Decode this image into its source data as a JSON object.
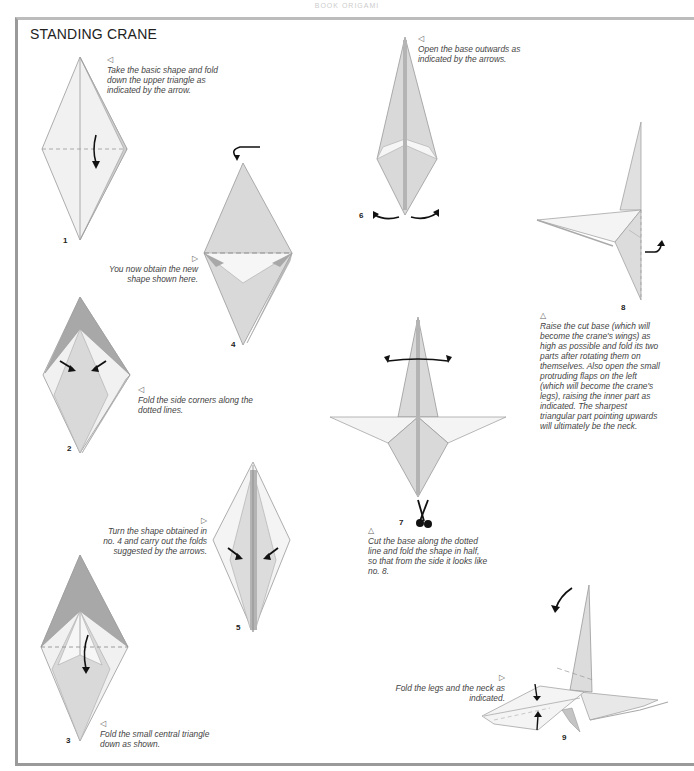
{
  "page_header": "BOOK ORIGAMI",
  "title": "STANDING CRANE",
  "colors": {
    "light_paper": "#f1f1f1",
    "mid_paper": "#d9d9d9",
    "dark_paper": "#a8a8a8",
    "edge": "#999999",
    "arrow": "#111111",
    "frame": "#9a9a9a"
  },
  "steps": [
    {
      "number": "1",
      "marker": "◁",
      "caption": "Take the basic shape and fold down the upper triangle as indicated by the arrow."
    },
    {
      "number": "2",
      "marker": "◁",
      "caption": "Fold the side corners along the dotted lines."
    },
    {
      "number": "3",
      "marker": "◁",
      "caption": "Fold the small central triangle down as shown."
    },
    {
      "number": "4",
      "marker": "▷",
      "caption": "You now obtain the new shape shown here."
    },
    {
      "number": "5",
      "marker": "▷",
      "caption": "Turn the shape obtained in no. 4 and carry out the folds suggested by the arrows."
    },
    {
      "number": "6",
      "marker": "◁",
      "caption": "Open the base outwards as indicated by the arrows."
    },
    {
      "number": "7",
      "marker": "△",
      "caption": "Cut the base along the dotted line and fold the shape in half, so that from the side it looks like no. 8."
    },
    {
      "number": "8",
      "marker": "△",
      "caption": "Raise the cut base (which will become the crane's wings) as high as possible and fold its two parts after rotating them on themselves. Also open the small protruding flaps on the left (which will become the crane's legs), raising the inner part as indicated. The sharpest triangular part pointing upwards will ultimately be the neck."
    },
    {
      "number": "9",
      "marker": "▷",
      "caption": "Fold the legs and the neck as indicated."
    }
  ]
}
